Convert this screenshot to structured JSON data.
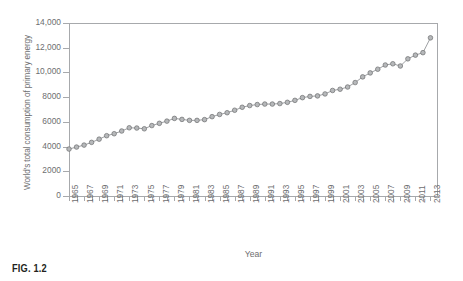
{
  "figure": {
    "caption": "FIG. 1.2"
  },
  "chart_data": {
    "type": "line",
    "title": "",
    "xlabel": "Year",
    "ylabel": "World's total consumption of primary energy",
    "xlim": [
      1965,
      2014
    ],
    "ylim": [
      0,
      14000
    ],
    "grid": false,
    "legend": null,
    "y_ticks": [
      0,
      2000,
      4000,
      6000,
      8000,
      10000,
      12000,
      14000
    ],
    "y_tick_labels": [
      "0",
      "2000",
      "4000",
      "6000",
      "8000",
      "10,000",
      "12,000",
      "14,000"
    ],
    "x_tick_labels": [
      "1965",
      "1967",
      "1969",
      "1971",
      "1973",
      "1975",
      "1977",
      "1979",
      "1981",
      "1983",
      "1985",
      "1987",
      "1989",
      "1991",
      "1993",
      "1995",
      "1997",
      "1999",
      "2001",
      "2003",
      "2005",
      "2007",
      "2009",
      "2011",
      "2013"
    ],
    "marker": "circle",
    "series": [
      {
        "name": "World's total consumption of primary energy",
        "x": [
          1965,
          1966,
          1967,
          1968,
          1969,
          1970,
          1971,
          1972,
          1973,
          1974,
          1975,
          1976,
          1977,
          1978,
          1979,
          1980,
          1981,
          1982,
          1983,
          1984,
          1985,
          1986,
          1987,
          1988,
          1989,
          1990,
          1991,
          1992,
          1993,
          1994,
          1995,
          1996,
          1997,
          1998,
          1999,
          2000,
          2001,
          2002,
          2003,
          2004,
          2005,
          2006,
          2007,
          2008,
          2009,
          2010,
          2011,
          2012,
          2013
        ],
        "values": [
          3800,
          3960,
          4120,
          4340,
          4600,
          4880,
          5040,
          5260,
          5520,
          5500,
          5440,
          5700,
          5880,
          6060,
          6280,
          6200,
          6120,
          6120,
          6180,
          6420,
          6600,
          6740,
          6940,
          7180,
          7320,
          7400,
          7440,
          7440,
          7480,
          7580,
          7740,
          7960,
          8060,
          8100,
          8260,
          8540,
          8640,
          8820,
          9180,
          9640,
          9960,
          10260,
          10600,
          10700,
          10520,
          11100,
          11400,
          11600,
          12800
        ]
      }
    ]
  }
}
